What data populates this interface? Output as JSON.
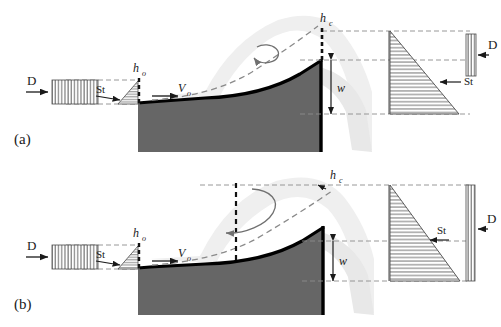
{
  "figure": {
    "type": "schematic-diagram",
    "panels": [
      {
        "id": "a",
        "label": "(a)",
        "inlet_label": "D",
        "shear_label": "St",
        "depth_label": "h",
        "depth_sub": "o",
        "velocity_label": "V",
        "velocity_sub": "o",
        "crest_label": "h",
        "crest_sub": "c",
        "drop_label": "w",
        "out_shear_label": "St",
        "out_diffusion_label": "D",
        "vortex": "small-circular-ccw"
      },
      {
        "id": "b",
        "label": "(b)",
        "inlet_label": "D",
        "shear_label": "St",
        "depth_label": "h",
        "depth_sub": "o",
        "velocity_label": "V",
        "velocity_sub": "o",
        "crest_label": "h",
        "crest_sub": "c",
        "drop_label": "w",
        "out_shear_label": "St",
        "out_diffusion_label": "D",
        "vortex": "large-elliptical-ccw"
      }
    ]
  },
  "colors": {
    "bed": "#666666",
    "bed_edge": "#000000",
    "plume": "#efefef",
    "curtain": "#e8e8e8",
    "dash": "#8c8c8c",
    "ink": "#1a1a1a",
    "hatch": "#555555",
    "background": "#ffffff"
  }
}
